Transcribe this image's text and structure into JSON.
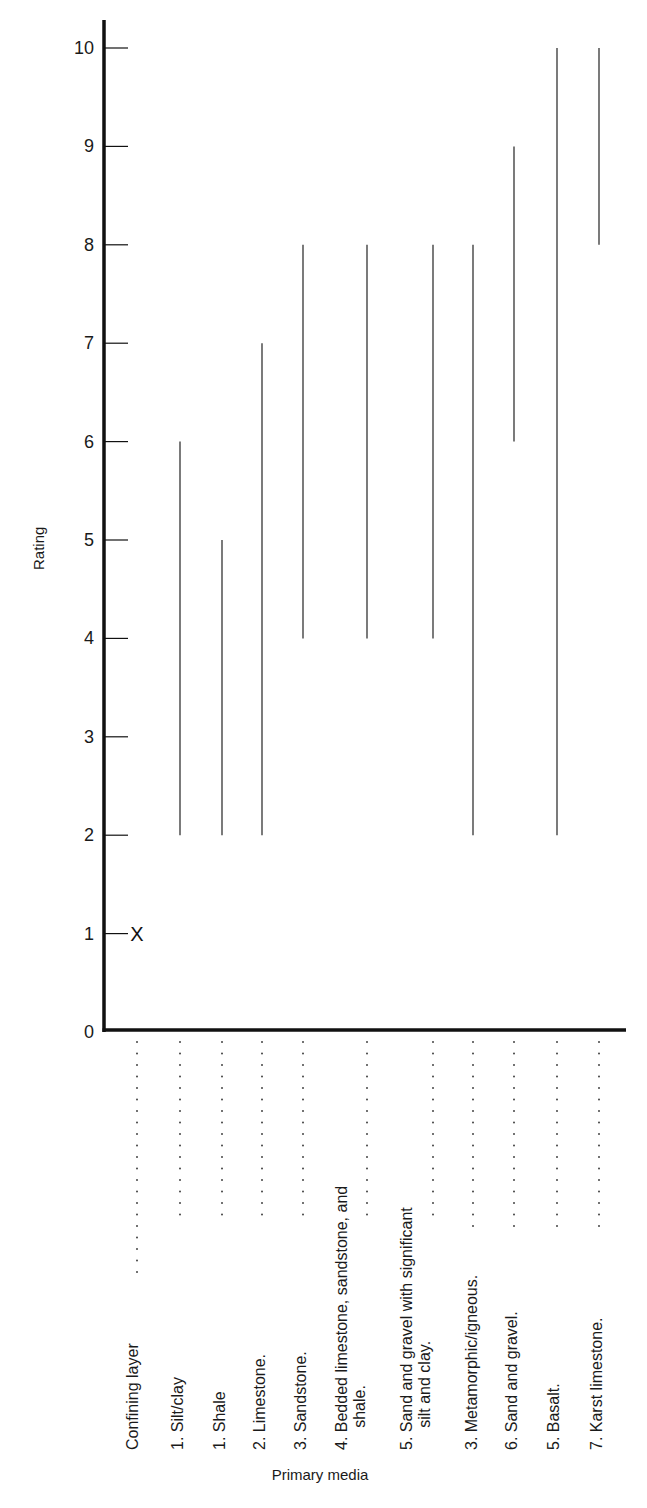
{
  "chart_data": {
    "type": "range",
    "title": "",
    "xlabel": "Primary media",
    "ylabel": "Rating",
    "ylim": [
      0,
      10
    ],
    "y_ticks": [
      0,
      1,
      2,
      3,
      4,
      5,
      6,
      7,
      8,
      9,
      10
    ],
    "grid": false,
    "legend": null,
    "categories": [
      "Confining layer",
      "1. Silt/clay",
      "1. Shale",
      "2. Limestone.",
      "3. Sandstone.",
      "4. Bedded limestone, sandstone, and shale.",
      "5. Sand and gravel with significant silt and clay.",
      "3. Metamorphic/igneous.",
      "6. Sand and gravel.",
      "5. Basalt.",
      "7. Karst limestone."
    ],
    "ranges": [
      {
        "category": "Confining layer",
        "min": 1,
        "max": 1,
        "marker": "X",
        "typical": 1
      },
      {
        "category": "1. Silt/clay",
        "min": 2,
        "max": 6,
        "typical": 1
      },
      {
        "category": "1. Shale",
        "min": 2,
        "max": 5,
        "typical": 1
      },
      {
        "category": "2. Limestone.",
        "min": 2,
        "max": 7,
        "typical": 2
      },
      {
        "category": "3. Sandstone.",
        "min": 4,
        "max": 8,
        "typical": 3
      },
      {
        "category": "4. Bedded limestone, sandstone, and shale.",
        "min": 4,
        "max": 8,
        "typical": 4
      },
      {
        "category": "5. Sand and gravel with significant silt and clay.",
        "min": 4,
        "max": 8,
        "typical": 5
      },
      {
        "category": "3. Metamorphic/igneous.",
        "min": 2,
        "max": 8,
        "typical": 3
      },
      {
        "category": "6. Sand and gravel.",
        "min": 6,
        "max": 9,
        "typical": 6
      },
      {
        "category": "5. Basalt.",
        "min": 2,
        "max": 10,
        "typical": 5
      },
      {
        "category": "7. Karst limestone.",
        "min": 8,
        "max": 10,
        "typical": 7
      }
    ]
  },
  "axis": {
    "y_label": "Rating",
    "x_label": "Primary media",
    "y_tick_labels": [
      "0",
      "1",
      "2",
      "3",
      "4",
      "5",
      "6",
      "7",
      "8",
      "9",
      "10"
    ]
  },
  "labels": {
    "cat0": "Confining layer",
    "cat1": "1. Silt/clay",
    "cat2": "1. Shale",
    "cat3": "2. Limestone.",
    "cat4": "3. Sandstone.",
    "cat5a": "4. Bedded limestone, sandstone, and",
    "cat5b": "shale.",
    "cat6a": "5. Sand and gravel with significant",
    "cat6b": "silt and clay.",
    "cat7": "3. Metamorphic/igneous.",
    "cat8": "6. Sand and gravel.",
    "cat9": "5. Basalt.",
    "cat10": "7. Karst limestone.",
    "x_marker": "X"
  },
  "colors": {
    "axis": "#111111",
    "range_line": "#333333",
    "dots": "#444444",
    "text": "#1a1a1a"
  }
}
